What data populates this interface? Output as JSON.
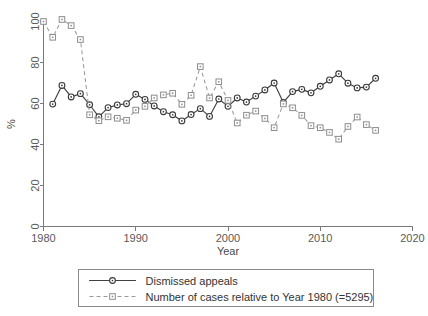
{
  "chart_data": {
    "type": "line",
    "title": "",
    "xlabel": "Year",
    "ylabel": "%",
    "xlim": [
      1980,
      2020
    ],
    "ylim": [
      0,
      100
    ],
    "grid": false,
    "legend_position": "bottom-outside",
    "xticks": [
      "1980",
      "1990",
      "2000",
      "2010",
      "2020"
    ],
    "xtick_values": [
      1980,
      1990,
      2000,
      2010,
      2020
    ],
    "yticks": [
      "0",
      "20",
      "40",
      "60",
      "80",
      "100"
    ],
    "ytick_values": [
      0,
      20,
      40,
      60,
      80,
      100
    ],
    "x": [
      1981,
      1982,
      1983,
      1984,
      1985,
      1986,
      1987,
      1988,
      1989,
      1990,
      1991,
      1992,
      1993,
      1994,
      1995,
      1996,
      1997,
      1998,
      1999,
      2000,
      2001,
      2002,
      2003,
      2004,
      2005,
      2006,
      2007,
      2008,
      2009,
      2010,
      2011,
      2012,
      2013,
      2014,
      2015,
      2016
    ],
    "series": [
      {
        "name": "Dismissed appeals",
        "marker": "circle",
        "linestyle": "solid",
        "color": "#3a3a3a",
        "x": [
          1981,
          1982,
          1983,
          1984,
          1985,
          1986,
          1987,
          1988,
          1989,
          1990,
          1991,
          1992,
          1993,
          1994,
          1995,
          1996,
          1997,
          1998,
          1999,
          2000,
          2001,
          2002,
          2003,
          2004,
          2005,
          2006,
          2007,
          2008,
          2009,
          2010,
          2011,
          2012,
          2013,
          2014,
          2015,
          2016
        ],
        "values": [
          59.7,
          68.8,
          63.2,
          64.8,
          59.4,
          53.5,
          58.0,
          59.3,
          59.9,
          64.5,
          62.0,
          58.8,
          56.0,
          54.5,
          51.5,
          54.6,
          57.5,
          53.7,
          62.2,
          58.6,
          62.7,
          60.7,
          63.6,
          66.6,
          70.0,
          60.5,
          65.8,
          66.9,
          65.2,
          68.4,
          71.5,
          74.5,
          69.9,
          67.6,
          68.0,
          72.3
        ]
      },
      {
        "name": "Number of cases relative to Year 1980 (=5295)",
        "marker": "square",
        "linestyle": "dashed",
        "color": "#8d8d8d",
        "x": [
          1980,
          1981,
          1982,
          1983,
          1984,
          1985,
          1986,
          1987,
          1988,
          1989,
          1990,
          1991,
          1992,
          1993,
          1994,
          1995,
          1996,
          1997,
          1998,
          1999,
          2000,
          2001,
          2002,
          2003,
          2004,
          2005,
          2006,
          2007,
          2008,
          2009,
          2010,
          2011,
          2012,
          2013,
          2014,
          2015,
          2016
        ],
        "values": [
          100.0,
          92.3,
          101.0,
          98.0,
          91.2,
          54.5,
          51.6,
          53.5,
          52.8,
          51.8,
          56.8,
          58.6,
          62.7,
          64.2,
          65.0,
          59.6,
          64.0,
          78.0,
          62.7,
          70.6,
          61.5,
          50.5,
          54.3,
          56.3,
          52.7,
          48.2,
          59.8,
          57.9,
          54.2,
          49.2,
          48.2,
          45.9,
          42.6,
          48.8,
          53.4,
          49.7,
          46.9
        ]
      }
    ]
  },
  "legend": {
    "entries": [
      {
        "label": "Dismissed appeals",
        "marker": "circle",
        "style": "solid"
      },
      {
        "label": "Number of cases relative to Year 1980 (=5295)",
        "marker": "square",
        "style": "dashed"
      }
    ]
  },
  "axes": {
    "x_title": "Year",
    "y_title": "%"
  },
  "colors": {
    "background": "#ffffff",
    "axis": "#7a7a7a",
    "solid_series": "#3a3a3a",
    "dashed_series": "#8d8d8d",
    "text": "#3a3a3a"
  }
}
